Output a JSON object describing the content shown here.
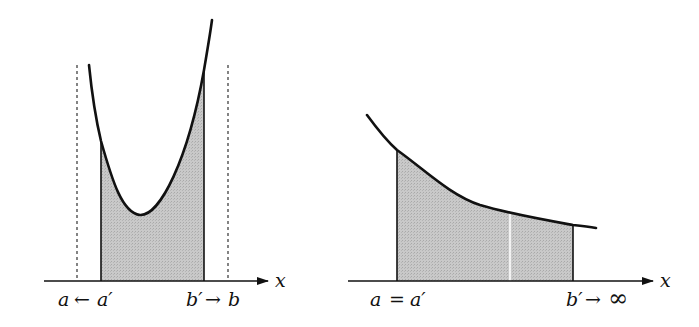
{
  "colors": {
    "curve": "#111111",
    "axis": "#111111",
    "fill": "#c4c4c4",
    "dashed": "#333333",
    "divider": "#ffffff"
  },
  "left_plot": {
    "axis_label": "x",
    "label_left": {
      "var": "a",
      "arrow": "←",
      "var2": "a′"
    },
    "label_right": {
      "var": "b′",
      "arrow": "→",
      "var2": "b"
    },
    "description": "Improper integral with singularities at endpoints a and b; shaded area between a′ and b′ under convex curve"
  },
  "right_plot": {
    "axis_label": "x",
    "label_left": {
      "var": "a",
      "arrow": "=",
      "var2": "a′"
    },
    "label_right": {
      "var": "b′",
      "arrow": "→",
      "var2": "∞"
    },
    "description": "Improper integral over infinite interval; shaded area under decreasing curve from a=a′ to b′"
  }
}
